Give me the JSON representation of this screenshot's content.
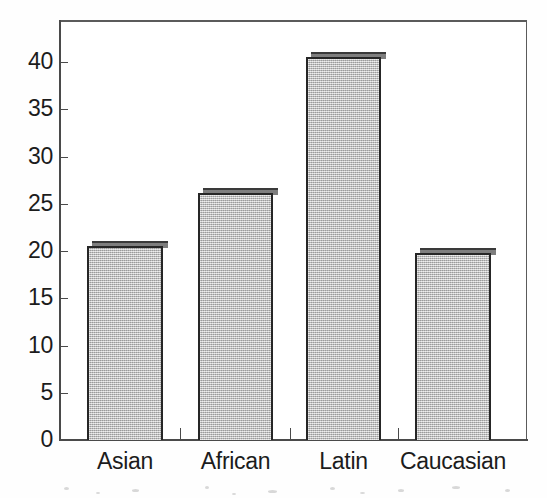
{
  "chart_data": {
    "type": "bar",
    "title": "",
    "subtitle": "",
    "xlabel": "",
    "ylabel": "",
    "categories": [
      "Asian",
      "African",
      "Latin",
      "Caucasian"
    ],
    "values": [
      20.5,
      26.1,
      40.5,
      19.8
    ],
    "series": [
      {
        "name": "",
        "values": [
          20.5,
          26.1,
          40.5,
          19.8
        ]
      }
    ],
    "ylim": [
      0,
      40
    ],
    "xlim": [
      0,
      4
    ],
    "y_ticks": [
      0,
      5,
      10,
      15,
      20,
      25,
      30,
      35,
      40
    ],
    "y_tick_labels": [
      "0",
      "5",
      "10",
      "15",
      "20",
      "25",
      "30",
      "35",
      "40"
    ],
    "x_tick_labels": [
      "Asian",
      "African",
      "Latin",
      "Caucasian"
    ],
    "grid": false,
    "legend": null,
    "legend_position": "none",
    "annotations": [],
    "bar_fill_color": "#b9b9b9",
    "bar_edge_color": "#262626",
    "axis_color": "#4a4a4a",
    "background_color": "#ffffff",
    "frame": true
  },
  "axis": {
    "y_labels": [
      "40",
      "35",
      "30",
      "25",
      "20",
      "15",
      "10",
      "5",
      "0"
    ],
    "x_labels": [
      "Asian",
      "African",
      "Latin",
      "Caucasian"
    ]
  }
}
